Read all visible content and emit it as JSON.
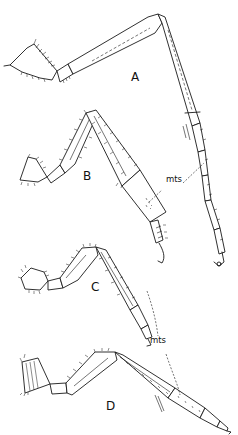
{
  "figure": {
    "panels": [
      {
        "id": "A",
        "label": "A"
      },
      {
        "id": "B",
        "label": "B"
      },
      {
        "id": "C",
        "label": "C"
      },
      {
        "id": "D",
        "label": "D"
      }
    ],
    "annotations": [
      {
        "text": "mts",
        "target": "metatarsus (legs A and B)"
      },
      {
        "text": "mts",
        "target": "metatarsus (legs C and D)"
      }
    ],
    "line_color": "#1a1a1a",
    "background": "#ffffff"
  }
}
